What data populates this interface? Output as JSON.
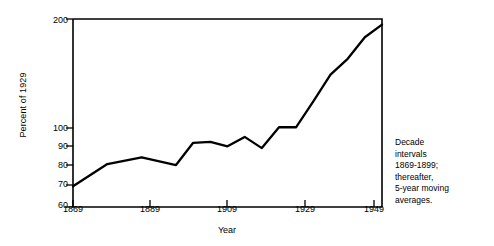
{
  "chart_data": {
    "type": "line",
    "title": "",
    "xlabel": "Year",
    "ylabel": "Percent of 1929",
    "yscale": "log",
    "ylim": [
      60,
      200
    ],
    "xlim": [
      1869,
      1959
    ],
    "grid": false,
    "legend": null,
    "ytick_labels": [
      "200",
      "100",
      "90",
      "80",
      "70",
      "60"
    ],
    "ytick_values": [
      200,
      100,
      90,
      80,
      70,
      60
    ],
    "xtick_labels": [
      "1869",
      "1889",
      "1909",
      "1929",
      "1949"
    ],
    "xtick_values": [
      1869,
      1889,
      1909,
      1929,
      1949
    ],
    "annotation": "Decade intervals 1869-1899; thereafter, 5-year moving averages.",
    "series": [
      {
        "name": "Percent of 1929",
        "x": [
          1869,
          1879,
          1889,
          1899,
          1904,
          1909,
          1914,
          1919,
          1924,
          1929,
          1934,
          1939,
          1944,
          1949,
          1954,
          1959
        ],
        "values": [
          68.5,
          79,
          82.5,
          78.5,
          90.5,
          91,
          88.5,
          94,
          87.5,
          100,
          100,
          118,
          140,
          155,
          178,
          193
        ]
      }
    ]
  },
  "annotation_lines": [
    "Decade",
    "intervals",
    "1869-1899;",
    "thereafter,",
    "5-year moving",
    "averages."
  ]
}
